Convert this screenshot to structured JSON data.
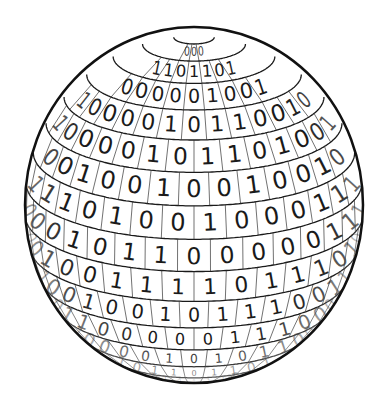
{
  "image": {
    "subject": "binary-sphere",
    "description": "Globe covered in a grid of binary digits",
    "colors": {
      "background": "#ffffff",
      "ink": "#1a1a1a",
      "outline": "#111111"
    },
    "sphere": {
      "cx": 194,
      "cy": 205,
      "rx": 169,
      "ry": 178
    }
  },
  "rows": [
    "000",
    "1101101",
    "000001001",
    "1000010110010",
    "10000101101001",
    "0010010010010",
    "11101001000111",
    "000101100000111",
    "0010011110111010",
    "01001001011100110",
    "0011000001110000",
    "1000010101100",
    "101101101",
    "1100110",
    "11011",
    "101"
  ]
}
